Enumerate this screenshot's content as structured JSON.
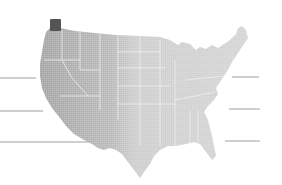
{
  "map": {
    "region": "United States (contiguous)",
    "style": "grayscale shaded relief",
    "colors": {
      "background": "#ffffff",
      "land": "#c9c9c9",
      "land_light": "#d8d8d8",
      "relief_dark": "#9a9a9a",
      "borders": "#efefef",
      "marker": "#555555",
      "guide_lines": "#9e9e9e"
    },
    "highlight_marker": {
      "state": "Washington",
      "shape": "square",
      "x": 50,
      "y": 19,
      "w": 11,
      "h": 12
    },
    "guide_lines": [
      {
        "side": "left",
        "x1": 0,
        "x2": 36,
        "y": 78
      },
      {
        "side": "left",
        "x1": 0,
        "x2": 43,
        "y": 111
      },
      {
        "side": "left",
        "x1": 0,
        "x2": 107,
        "y": 142
      },
      {
        "side": "right",
        "x1": 232,
        "x2": 259,
        "y": 77
      },
      {
        "side": "right",
        "x1": 229,
        "x2": 260,
        "y": 109
      },
      {
        "side": "right",
        "x1": 225,
        "x2": 260,
        "y": 141
      }
    ]
  }
}
